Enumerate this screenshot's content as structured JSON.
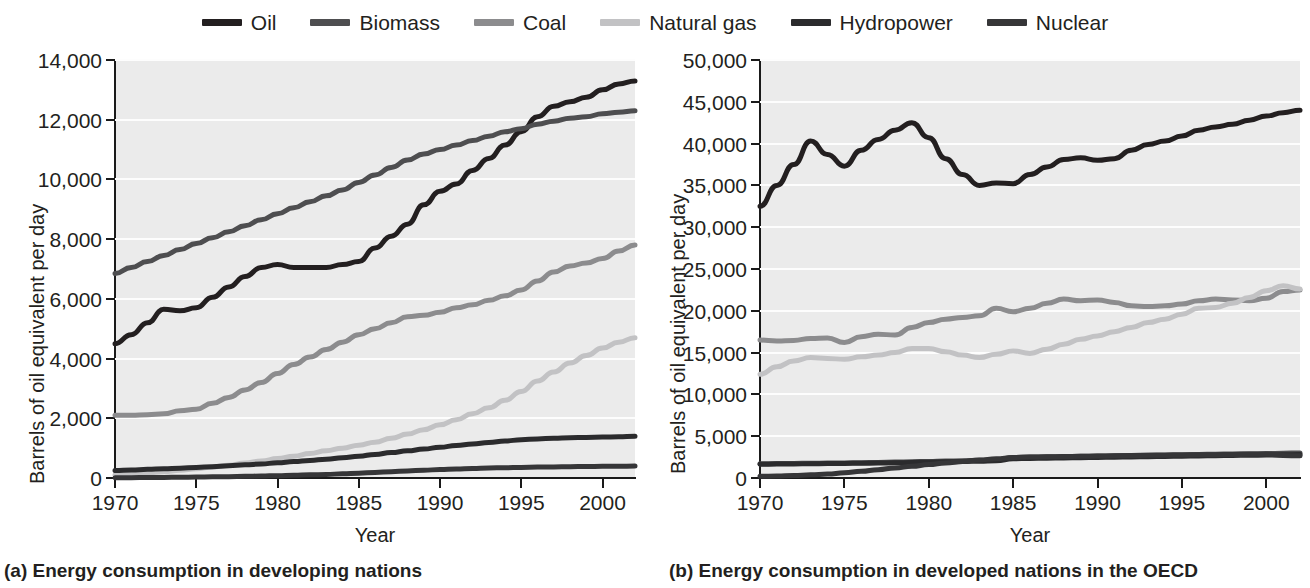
{
  "legend": {
    "items": [
      {
        "label": "Oil",
        "color": "#231f20"
      },
      {
        "label": "Biomass",
        "color": "#4e4e50"
      },
      {
        "label": "Coal",
        "color": "#8c8c8e"
      },
      {
        "label": "Natural gas",
        "color": "#c2c2c4"
      },
      {
        "label": "Hydropower",
        "color": "#2b2b2d"
      },
      {
        "label": "Nuclear",
        "color": "#363638"
      }
    ]
  },
  "panels": {
    "a": {
      "caption": "(a) Energy consumption in developing nations",
      "ylabel": "Barrels of oil equivalent per day",
      "xlabel": "Year"
    },
    "b": {
      "caption": "(b) Energy consumption in developed nations in the OECD",
      "ylabel": "Barrels of oil equivalent per day",
      "xlabel": "Year"
    }
  },
  "chart_data": [
    {
      "type": "line",
      "title": "(a) Energy consumption in developing nations",
      "xlabel": "Year",
      "ylabel": "Barrels of oil equivalent per day",
      "xlim": [
        1970,
        2002
      ],
      "ylim": [
        0,
        14000
      ],
      "yticks": [
        0,
        2000,
        4000,
        6000,
        8000,
        10000,
        12000,
        14000
      ],
      "ytick_labels": [
        "0",
        "2,000",
        "4,000",
        "6,000",
        "8,000",
        "10,000",
        "12,000",
        "14,000"
      ],
      "xticks": [
        1970,
        1975,
        1980,
        1985,
        1990,
        1995,
        2000
      ],
      "xtick_labels": [
        "1970",
        "1975",
        "1980",
        "1985",
        "1990",
        "1995",
        "2000"
      ],
      "grid": true,
      "legend_position": "top-center",
      "x": [
        1970,
        1971,
        1972,
        1973,
        1974,
        1975,
        1976,
        1977,
        1978,
        1979,
        1980,
        1981,
        1982,
        1983,
        1984,
        1985,
        1986,
        1987,
        1988,
        1989,
        1990,
        1991,
        1992,
        1993,
        1994,
        1995,
        1996,
        1997,
        1998,
        1999,
        2000,
        2001,
        2002
      ],
      "series": [
        {
          "name": "Oil",
          "color": "#231f20",
          "values": [
            4500,
            4800,
            5200,
            5650,
            5600,
            5700,
            6050,
            6400,
            6750,
            7050,
            7150,
            7050,
            7050,
            7050,
            7150,
            7250,
            7700,
            8100,
            8500,
            9150,
            9600,
            9850,
            10300,
            10700,
            11150,
            11600,
            12100,
            12450,
            12600,
            12750,
            13000,
            13200,
            13300
          ]
        },
        {
          "name": "Biomass",
          "color": "#4e4e50",
          "values": [
            6850,
            7050,
            7250,
            7450,
            7650,
            7850,
            8050,
            8250,
            8450,
            8650,
            8850,
            9050,
            9250,
            9450,
            9650,
            9900,
            10150,
            10400,
            10650,
            10850,
            11000,
            11150,
            11300,
            11450,
            11600,
            11700,
            11850,
            11950,
            12050,
            12100,
            12200,
            12250,
            12300
          ]
        },
        {
          "name": "Coal",
          "color": "#8c8c8e",
          "values": [
            2100,
            2100,
            2120,
            2150,
            2250,
            2300,
            2500,
            2700,
            2950,
            3200,
            3500,
            3800,
            4050,
            4300,
            4550,
            4800,
            5000,
            5200,
            5400,
            5450,
            5550,
            5700,
            5800,
            5950,
            6100,
            6300,
            6600,
            6900,
            7100,
            7200,
            7350,
            7600,
            7800
          ]
        },
        {
          "name": "Natural gas",
          "color": "#c2c2c4",
          "values": [
            100,
            130,
            170,
            210,
            260,
            310,
            370,
            430,
            500,
            570,
            650,
            730,
            820,
            910,
            1000,
            1100,
            1200,
            1330,
            1470,
            1620,
            1780,
            1950,
            2150,
            2350,
            2600,
            2900,
            3250,
            3550,
            3850,
            4100,
            4350,
            4550,
            4700
          ]
        },
        {
          "name": "Hydropower",
          "color": "#2b2b2d",
          "values": [
            250,
            270,
            290,
            310,
            330,
            350,
            380,
            410,
            440,
            470,
            510,
            550,
            590,
            630,
            680,
            730,
            790,
            850,
            910,
            970,
            1030,
            1090,
            1140,
            1190,
            1240,
            1280,
            1310,
            1330,
            1350,
            1360,
            1370,
            1380,
            1400
          ]
        },
        {
          "name": "Nuclear",
          "color": "#363638",
          "values": [
            10,
            12,
            15,
            20,
            25,
            30,
            38,
            46,
            55,
            65,
            78,
            90,
            105,
            120,
            140,
            160,
            185,
            210,
            235,
            260,
            285,
            305,
            320,
            335,
            345,
            355,
            365,
            372,
            378,
            385,
            390,
            395,
            400
          ]
        }
      ]
    },
    {
      "type": "line",
      "title": "(b) Energy consumption in developed nations in the OECD",
      "xlabel": "Year",
      "ylabel": "Barrels of oil equivalent per day",
      "xlim": [
        1970,
        2002
      ],
      "ylim": [
        0,
        50000
      ],
      "yticks": [
        0,
        5000,
        10000,
        15000,
        20000,
        25000,
        30000,
        35000,
        40000,
        45000,
        50000
      ],
      "ytick_labels": [
        "0",
        "5,000",
        "10,000",
        "15,000",
        "20,000",
        "25,000",
        "30,000",
        "35,000",
        "40,000",
        "45,000",
        "50,000"
      ],
      "xticks": [
        1970,
        1975,
        1980,
        1985,
        1990,
        1995,
        2000
      ],
      "xtick_labels": [
        "1970",
        "1975",
        "1980",
        "1985",
        "1990",
        "1995",
        "2000"
      ],
      "grid": true,
      "legend_position": "top-center",
      "x": [
        1970,
        1971,
        1972,
        1973,
        1974,
        1975,
        1976,
        1977,
        1978,
        1979,
        1980,
        1981,
        1982,
        1983,
        1984,
        1985,
        1986,
        1987,
        1988,
        1989,
        1990,
        1991,
        1992,
        1993,
        1994,
        1995,
        1996,
        1997,
        1998,
        1999,
        2000,
        2001,
        2002
      ],
      "series": [
        {
          "name": "Oil",
          "color": "#231f20",
          "values": [
            32500,
            35000,
            37500,
            40300,
            38700,
            37300,
            39200,
            40500,
            41600,
            42500,
            40700,
            38200,
            36300,
            35000,
            35300,
            35200,
            36300,
            37200,
            38100,
            38300,
            38000,
            38200,
            39200,
            39900,
            40300,
            40900,
            41600,
            42000,
            42300,
            42800,
            43300,
            43700,
            44000
          ]
        },
        {
          "name": "Coal",
          "color": "#8c8c8e",
          "values": [
            16500,
            16400,
            16450,
            16700,
            16750,
            16200,
            16900,
            17200,
            17100,
            18000,
            18600,
            19000,
            19200,
            19400,
            20300,
            19900,
            20300,
            20900,
            21400,
            21200,
            21300,
            21000,
            20600,
            20500,
            20600,
            20800,
            21200,
            21400,
            21300,
            21200,
            21500,
            22300,
            22500
          ]
        },
        {
          "name": "Natural gas",
          "color": "#c2c2c4",
          "values": [
            12400,
            13300,
            14000,
            14400,
            14300,
            14200,
            14500,
            14700,
            15000,
            15500,
            15500,
            15100,
            14700,
            14400,
            14800,
            15200,
            14900,
            15400,
            16000,
            16600,
            17000,
            17500,
            18000,
            18600,
            19000,
            19600,
            20300,
            20400,
            20900,
            21600,
            22400,
            23000,
            22600
          ]
        },
        {
          "name": "Biomass",
          "color": "#4e4e50",
          "values": [
            1700,
            1720,
            1740,
            1760,
            1780,
            1800,
            1830,
            1860,
            1900,
            1940,
            1980,
            2020,
            2070,
            2120,
            2180,
            2450,
            2500,
            2530,
            2560,
            2600,
            2630,
            2660,
            2700,
            2730,
            2760,
            2790,
            2820,
            2850,
            2880,
            2900,
            2930,
            2960,
            3000
          ]
        },
        {
          "name": "Hydropower",
          "color": "#2b2b2d",
          "values": [
            1650,
            1660,
            1680,
            1700,
            1720,
            1740,
            1760,
            1790,
            1820,
            1850,
            1890,
            1930,
            1970,
            2010,
            2060,
            2300,
            2340,
            2370,
            2400,
            2430,
            2460,
            2490,
            2520,
            2550,
            2580,
            2610,
            2640,
            2670,
            2700,
            2720,
            2750,
            2780,
            2800
          ]
        },
        {
          "name": "Nuclear",
          "color": "#363638",
          "values": [
            200,
            240,
            300,
            380,
            480,
            620,
            800,
            1000,
            1200,
            1400,
            1600,
            1800,
            1980,
            2150,
            2300,
            2450,
            2500,
            2540,
            2570,
            2600,
            2630,
            2660,
            2690,
            2710,
            2730,
            2750,
            2770,
            2790,
            2810,
            2830,
            2850,
            2700,
            2650
          ]
        }
      ]
    }
  ]
}
